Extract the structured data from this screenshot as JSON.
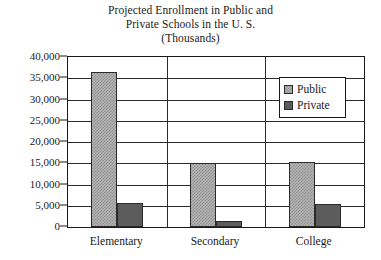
{
  "chart_data": {
    "type": "bar",
    "title": "Projected Enrollment in Public and Private Schools in the U. S. (Thousands)",
    "title_lines": [
      "Projected Enrollment in Public and",
      "Private Schools in the U. S.",
      "(Thousands)"
    ],
    "xlabel": "",
    "ylabel": "",
    "ylim": [
      0,
      40000
    ],
    "ytick_values": [
      0,
      5000,
      10000,
      15000,
      20000,
      25000,
      30000,
      35000,
      40000
    ],
    "ytick_labels": [
      "0",
      "5,000",
      "10,000",
      "15,000",
      "20,000",
      "25,000",
      "30,000",
      "35,000",
      "40,000"
    ],
    "grid": true,
    "grid_axis": "y",
    "legend_position": "upper right",
    "categories": [
      "Elementary",
      "Secondary",
      "College"
    ],
    "series": [
      {
        "name": "Public",
        "color": "#b4b4b4",
        "pattern": "checkerboard",
        "values": [
          36500,
          15000,
          15200
        ]
      },
      {
        "name": "Private",
        "color": "#5c5c5c",
        "pattern": "solid",
        "values": [
          5700,
          1400,
          5400
        ]
      }
    ]
  },
  "legend": {
    "entries": [
      {
        "label": "Public",
        "swatch": "public-swatch"
      },
      {
        "label": "Private",
        "swatch": "private-swatch"
      }
    ]
  },
  "colors": {
    "axis": "#1a1a1a",
    "grid": "#2b2b2b",
    "background": "#ffffff",
    "public": "#b4b4b4",
    "private": "#5c5c5c"
  }
}
